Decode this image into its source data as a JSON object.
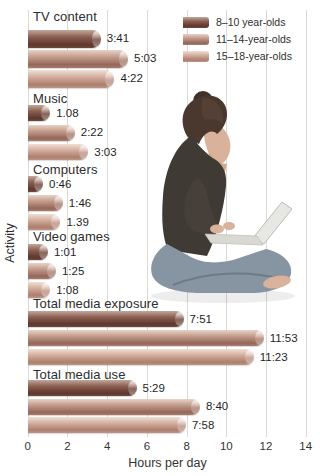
{
  "figure": {
    "photo_alt": "Young woman sitting cross-legged using a laptop",
    "colors": {
      "series_8_10": "#6f473c",
      "series_11_14": "#a87c6d",
      "series_15_18": "#c09484",
      "gridline": "#dcd8d4",
      "text": "#2d2d2d"
    }
  },
  "chart_data": {
    "type": "bar",
    "orientation": "horizontal",
    "title": "",
    "xlabel": "Hours per day",
    "ylabel": "Activity",
    "xlim": [
      0,
      14
    ],
    "xticks": [
      0,
      2,
      4,
      6,
      8,
      10,
      12,
      14
    ],
    "grid": true,
    "legend_position": "top-right",
    "categories": [
      "TV content",
      "Music",
      "Computers",
      "Video games",
      "Total media exposure",
      "Total media use"
    ],
    "series": [
      {
        "name": "8–10 year-olds",
        "labels": [
          "3:41",
          "1.08",
          "0:46",
          "1:01",
          "7:51",
          "5:29"
        ],
        "hours": [
          3.68,
          1.13,
          0.77,
          1.02,
          7.85,
          5.48
        ]
      },
      {
        "name": "11–14-year-olds",
        "labels": [
          "5:03",
          "2:22",
          "1:46",
          "1:25",
          "11:53",
          "8:40"
        ],
        "hours": [
          5.05,
          2.37,
          1.77,
          1.42,
          11.88,
          8.67
        ]
      },
      {
        "name": "15–18-year-olds",
        "labels": [
          "4:22",
          "3:03",
          "1.39",
          "1:08",
          "11:23",
          "7:58"
        ],
        "hours": [
          4.37,
          3.05,
          1.65,
          1.13,
          11.38,
          7.97
        ]
      }
    ]
  }
}
